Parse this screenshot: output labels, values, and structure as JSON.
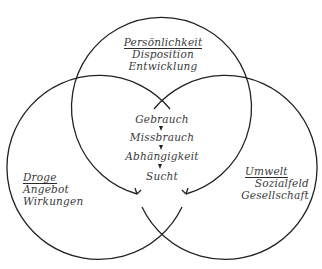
{
  "diagram": {
    "type": "venn",
    "colors": {
      "stroke": "#222222",
      "text": "#3a3a3a",
      "background": "#ffffff"
    },
    "circles": {
      "top": {
        "heading": "Persönlichkeit",
        "lines": [
          "Disposition",
          "Entwicklung"
        ]
      },
      "left": {
        "heading": "Droge",
        "lines": [
          "Angebot",
          "Wirkungen"
        ]
      },
      "right": {
        "heading": "Umwelt",
        "lines": [
          "Sozialfeld",
          "Gesellschaft"
        ]
      }
    },
    "center": {
      "stages": [
        "Gebrauch",
        "Missbrauch",
        "Abhängigkeit",
        "Sucht"
      ],
      "connector": "arrow-down"
    }
  }
}
